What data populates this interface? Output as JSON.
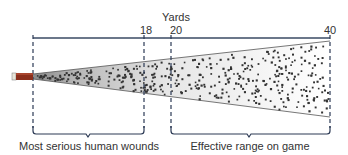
{
  "diagram": {
    "axis_title": "Yards",
    "ticks": [
      {
        "label": "18",
        "yards": 18
      },
      {
        "label": "20",
        "yards": 20
      },
      {
        "label": "40",
        "yards": 40
      }
    ],
    "regions": [
      {
        "label": "Most serious human wounds",
        "from_yards": 0,
        "to_yards": 18
      },
      {
        "label": "Effective range on game",
        "from_yards": 20,
        "to_yards": 40
      }
    ],
    "colors": {
      "line": "#3a4a63",
      "dashed": "#2c3a55",
      "shell_body": "#8b2f1c",
      "shell_base": "#e8e4d8",
      "cone_fill": "#f2f2f2",
      "pellet": "#333333",
      "text": "#333333"
    }
  }
}
